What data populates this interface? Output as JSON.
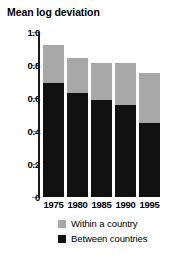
{
  "chart_data": {
    "type": "bar",
    "title": "Mean log deviation",
    "subtitle": "",
    "xlabel": "",
    "ylabel": "",
    "stacked": true,
    "grid": false,
    "legend_position": "bottom",
    "categories": [
      "1975",
      "1980",
      "1985",
      "1990",
      "1995"
    ],
    "ylim": [
      0,
      1.0
    ],
    "yticks": [
      "0",
      "0.2",
      "0.4",
      "0.6",
      "0.8",
      "1.0"
    ],
    "ytick_values": [
      0,
      0.2,
      0.4,
      0.6,
      0.8,
      1.0
    ],
    "series": [
      {
        "name": "Between countries",
        "color": "#111111",
        "values": [
          0.69,
          0.63,
          0.59,
          0.56,
          0.45
        ]
      },
      {
        "name": "Within a country",
        "color": "#a8a8a8",
        "values": [
          0.23,
          0.21,
          0.22,
          0.25,
          0.3
        ]
      }
    ],
    "totals": [
      0.92,
      0.84,
      0.81,
      0.81,
      0.75
    ]
  }
}
